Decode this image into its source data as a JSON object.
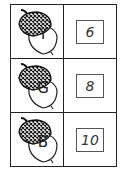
{
  "rows": [
    {
      "letter": "Y",
      "number": "6"
    },
    {
      "letter": "G",
      "number": "8"
    },
    {
      "letter": "B",
      "number": "10"
    }
  ],
  "colors": {
    "line": "#222222",
    "background": "#ffffff"
  },
  "icons": {
    "acorn": "acorn-icon"
  }
}
